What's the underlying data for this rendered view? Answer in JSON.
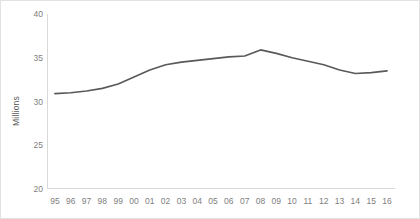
{
  "chart_data": {
    "type": "line",
    "title": "",
    "subtitle": "",
    "xlabel": "",
    "ylabel": "Millions",
    "categories": [
      "95",
      "96",
      "97",
      "98",
      "99",
      "00",
      "01",
      "02",
      "03",
      "04",
      "05",
      "06",
      "07",
      "08",
      "09",
      "10",
      "11",
      "12",
      "13",
      "14",
      "15",
      "16"
    ],
    "series": [
      {
        "name": "Millions",
        "color": "#595959",
        "values": [
          30.9,
          31.0,
          31.2,
          31.5,
          32.0,
          32.8,
          33.6,
          34.2,
          34.5,
          34.7,
          34.9,
          35.1,
          35.2,
          35.9,
          35.5,
          35.0,
          34.6,
          34.2,
          33.6,
          33.2,
          33.3,
          33.5
        ]
      }
    ],
    "ylim": [
      20,
      40
    ],
    "yticks": [
      20,
      25,
      30,
      35,
      40
    ],
    "ytick_labels": [
      "20",
      "25",
      "30",
      "35",
      "40"
    ],
    "xlim_index": [
      0,
      21
    ],
    "grid": false,
    "legend": false,
    "legend_position": "none",
    "axis_color": "#d9d9d9",
    "tick_label_color": "#808080",
    "frame_border_color": "#e2e2e2"
  }
}
